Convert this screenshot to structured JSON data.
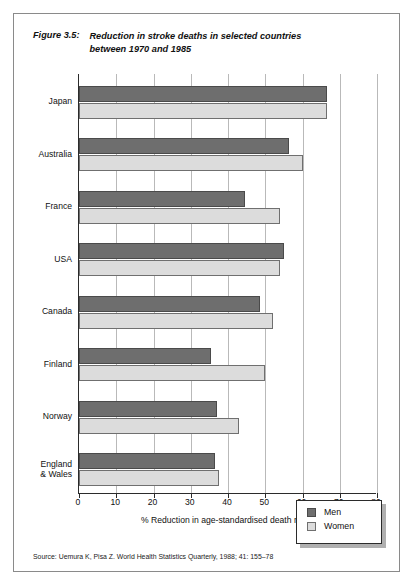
{
  "figure": {
    "label": "Figure 3.5:",
    "title_line1": "Reduction in stroke deaths in selected countries",
    "title_line2": "between 1970 and 1985",
    "source": "Source: Uemura K, Pisa Z. World Health Statistics Quarterly, 1988; 41: 155–78"
  },
  "legend": {
    "position": "inside-bottom-right",
    "items": [
      {
        "label": "Men",
        "color": "#6e6e6e"
      },
      {
        "label": "Women",
        "color": "#dcdcdc"
      }
    ]
  },
  "chart_data": {
    "type": "bar",
    "orientation": "horizontal",
    "title": "Reduction in stroke deaths in selected countries between 1970 and 1985",
    "xlabel": "% Reduction in age-standardised death rates",
    "ylabel": "",
    "xlim": [
      0,
      80
    ],
    "xticks": [
      0,
      10,
      20,
      30,
      40,
      50,
      60,
      70,
      80
    ],
    "grid": "vertical",
    "categories": [
      "Japan",
      "Australia",
      "France",
      "USA",
      "Canada",
      "Finland",
      "Norway",
      "England\n& Wales"
    ],
    "series": [
      {
        "name": "Men",
        "color": "#6e6e6e",
        "values": [
          66.5,
          56.5,
          44.5,
          55.0,
          48.5,
          35.5,
          37.0,
          36.5
        ]
      },
      {
        "name": "Women",
        "color": "#dcdcdc",
        "values": [
          66.5,
          60.0,
          54.0,
          54.0,
          52.0,
          50.0,
          43.0,
          37.5
        ]
      }
    ]
  }
}
